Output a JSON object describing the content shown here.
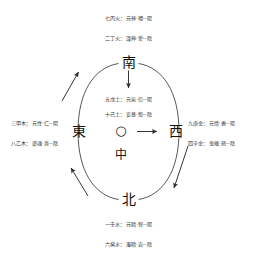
{
  "diagram": {
    "type": "wuxing-five-phase-directional-chart",
    "background_color": "#ffffff",
    "stroke_color": "#333333"
  },
  "cardinals": {
    "south": "南",
    "north": "北",
    "east": "東",
    "west": "西"
  },
  "center": {
    "ring_glyph": "○",
    "label": "中"
  },
  "phases": {
    "fire": {
      "position": "top",
      "yang_line": "七丙火：元神‧禮--陽",
      "yin_line": "二丁火：識神‧愛--陰"
    },
    "earth": {
      "position": "center",
      "yang_line": "五戊土：元氣‧信--陽",
      "yin_line": "十己土：妄意‧慾--陰"
    },
    "wood": {
      "position": "left",
      "yang_line": "三甲木：元性‧仁--陽",
      "yin_line": "八乙木：遊魂‧喜--陰"
    },
    "metal": {
      "position": "right",
      "yang_line": "九庚金：元情‧義--陽",
      "yin_line": "四辛金：鬼魄‧怒--陰"
    },
    "water": {
      "position": "bottom",
      "yang_line": "一壬水：元精‧智--陽",
      "yin_line": "六癸水：濁精‧哀--陰"
    }
  },
  "arrows": {
    "south_to_center": "arrow-down",
    "center_to_west": "arrow-right",
    "west_outer_down": "arrow-down-left",
    "north_outer_up": "arrow-up-left",
    "east_outer_up": "arrow-up-right"
  }
}
